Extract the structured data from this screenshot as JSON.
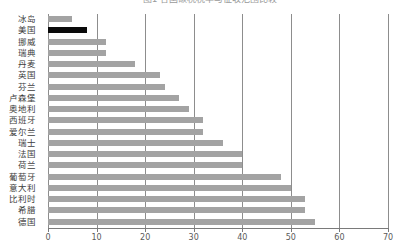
{
  "chart_data": {
    "type": "bar",
    "orientation": "horizontal",
    "title": "图1 各国碳税税率与征收范围比较",
    "xlabel": "",
    "ylabel": "",
    "xlim": [
      0,
      70
    ],
    "xticks": [
      0,
      10,
      20,
      30,
      40,
      50,
      60,
      70
    ],
    "grid": true,
    "legend": "none",
    "highlight_category": "美国",
    "colors": {
      "bar": "#a3a3a3",
      "highlight": "#0a0a0a",
      "grid": "#8d8d8d",
      "axis": "#7a7a7a"
    },
    "categories": [
      "冰岛",
      "美国",
      "挪威",
      "瑞典",
      "丹麦",
      "英国",
      "芬兰",
      "卢森堡",
      "奥地利",
      "西班牙",
      "爱尔兰",
      "瑞士",
      "法国",
      "荷兰",
      "葡萄牙",
      "意大利",
      "比利时",
      "希腊",
      "德国"
    ],
    "values": [
      5,
      8,
      12,
      12,
      18,
      23,
      24,
      27,
      29,
      32,
      32,
      36,
      40,
      40,
      48,
      50,
      53,
      53,
      55
    ]
  }
}
